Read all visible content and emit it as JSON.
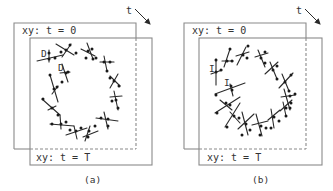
{
  "figure": {
    "width": 333,
    "height": 191,
    "line_color": "#8a8a8a",
    "ink_color": "#2a2a2a"
  },
  "panels": [
    {
      "id": "a",
      "caption": "(a)",
      "caption_pos": [
        84,
        183
      ],
      "frame_back": {
        "label": "xy: t = 0",
        "x": 14,
        "y": 23,
        "w": 122,
        "h": 126,
        "label_pos": [
          22,
          34
        ]
      },
      "frame_front": {
        "label": "xy: t = T",
        "x": 30,
        "y": 38,
        "w": 122,
        "h": 127,
        "label_pos": [
          36,
          161
        ]
      },
      "time_arrow": {
        "label": "t",
        "label_pos": [
          126,
          14
        ],
        "from": [
          135,
          9
        ],
        "to": [
          150,
          24
        ]
      },
      "marks": [
        {
          "text": "D",
          "pos": [
            41,
            57
          ]
        },
        {
          "text": "D",
          "pos": [
            58,
            71
          ]
        }
      ],
      "glyphs": [
        {
          "lines": [
            [
              [
                37,
                61
              ],
              [
                63,
                55
              ]
            ],
            [
              [
                49,
                50
              ],
              [
                49,
                62
              ]
            ]
          ],
          "dots": [
            [
              49,
              59
            ],
            [
              49,
              53
            ],
            [
              55,
              58
            ]
          ]
        },
        {
          "lines": [
            [
              [
                56,
                44
              ],
              [
                74,
                55
              ]
            ],
            [
              [
                62,
                57
              ],
              [
                71,
                44
              ]
            ]
          ],
          "dots": [
            [
              66,
              50
            ],
            [
              70,
              45
            ],
            [
              61,
              52
            ],
            [
              76,
              53
            ]
          ]
        },
        {
          "lines": [
            [
              [
                81,
                49
              ],
              [
                95,
                56
              ]
            ],
            [
              [
                87,
                43
              ],
              [
                93,
                59
              ]
            ]
          ],
          "dots": [
            [
              88,
              51
            ],
            [
              92,
              49
            ],
            [
              86,
              58
            ],
            [
              93,
              59
            ]
          ]
        },
        {
          "lines": [
            [
              [
                100,
                62
              ],
              [
                114,
                62
              ]
            ],
            [
              [
                104,
                56
              ],
              [
                107,
                71
              ]
            ]
          ],
          "dots": [
            [
              104,
              62
            ],
            [
              96,
              58
            ],
            [
              110,
              62
            ],
            [
              107,
              71
            ]
          ]
        },
        {
          "lines": [
            [
              [
                110,
                76
              ],
              [
                120,
                86
              ]
            ],
            [
              [
                118,
                74
              ],
              [
                110,
                88
              ]
            ]
          ],
          "dots": [
            [
              114,
              81
            ],
            [
              110,
              78
            ],
            [
              119,
              86
            ]
          ]
        },
        {
          "lines": [
            [
              [
                110,
                97
              ],
              [
                122,
                96
              ]
            ],
            [
              [
                114,
                91
              ],
              [
                118,
                110
              ]
            ]
          ],
          "dots": [
            [
              116,
              100
            ],
            [
              112,
              101
            ],
            [
              118,
              108
            ]
          ]
        },
        {
          "lines": [
            [
              [
                96,
                118
              ],
              [
                118,
                121
              ]
            ],
            [
              [
                104,
                112
              ],
              [
                108,
                129
              ]
            ]
          ],
          "dots": [
            [
              108,
              119
            ],
            [
              101,
              118
            ],
            [
              108,
              126
            ]
          ]
        },
        {
          "lines": [
            [
              [
                83,
                137
              ],
              [
                98,
                131
              ]
            ],
            [
              [
                90,
                126
              ],
              [
                85,
                141
              ]
            ]
          ],
          "dots": [
            [
              89,
              131
            ],
            [
              95,
              126
            ],
            [
              88,
              137
            ]
          ]
        },
        {
          "lines": [
            [
              [
                66,
                135
              ],
              [
                87,
                128
              ]
            ],
            [
              [
                74,
                126
              ],
              [
                77,
                139
              ]
            ]
          ],
          "dots": [
            [
              76,
              131
            ],
            [
              70,
              130
            ],
            [
              81,
              128
            ]
          ]
        },
        {
          "lines": [
            [
              [
                50,
                124
              ],
              [
                74,
                126
              ]
            ],
            [
              [
                60,
                115
              ],
              [
                61,
                129
              ]
            ]
          ],
          "dots": [
            [
              61,
              124
            ],
            [
              52,
              124
            ],
            [
              66,
              122
            ]
          ]
        },
        {
          "lines": [
            [
              [
                42,
                99
              ],
              [
                60,
                115
              ]
            ],
            [
              [
                48,
                110
              ],
              [
                56,
                106
              ]
            ]
          ],
          "dots": [
            [
              52,
              108
            ],
            [
              43,
              99
            ],
            [
              58,
              115
            ]
          ]
        },
        {
          "lines": [
            [
              [
                50,
                75
              ],
              [
                58,
                102
              ]
            ],
            [
              [
                52,
                94
              ],
              [
                58,
                86
              ]
            ]
          ],
          "dots": [
            [
              54,
              89
            ],
            [
              50,
              75
            ],
            [
              57,
              87
            ]
          ]
        },
        {
          "lines": [
            [
              [
                62,
                64
              ],
              [
                68,
                82
              ]
            ],
            [
              [
                60,
                73
              ],
              [
                70,
                72
              ]
            ]
          ],
          "dots": [
            [
              66,
              73
            ],
            [
              68,
              72
            ],
            [
              62,
              82
            ]
          ]
        }
      ]
    },
    {
      "id": "b",
      "caption": "(b)",
      "caption_pos": [
        252,
        183
      ],
      "frame_back": {
        "label": "xy: t = 0",
        "x": 184,
        "y": 23,
        "w": 122,
        "h": 126,
        "label_pos": [
          192,
          34
        ]
      },
      "frame_front": {
        "label": "xy: t = T",
        "x": 199,
        "y": 38,
        "w": 123,
        "h": 127,
        "label_pos": [
          207,
          161
        ]
      },
      "time_arrow": {
        "label": "t",
        "label_pos": [
          296,
          14
        ],
        "from": [
          305,
          9
        ],
        "to": [
          320,
          24
        ]
      },
      "marks": [
        {
          "text": "I",
          "pos": [
            209,
            72
          ]
        },
        {
          "text": "I",
          "pos": [
            224,
            86
          ]
        }
      ],
      "glyphs": [
        {
          "lines": [
            [
              [
                216,
                59
              ],
              [
                216,
                85
              ]
            ],
            [
              [
                211,
                74
              ],
              [
                222,
                70
              ]
            ]
          ],
          "dots": [
            [
              216,
              72
            ],
            [
              216,
              60
            ],
            [
              221,
              70
            ]
          ]
        },
        {
          "lines": [
            [
              [
                224,
                67
              ],
              [
                230,
                49
              ]
            ],
            [
              [
                222,
                61
              ],
              [
                233,
                61
              ]
            ]
          ],
          "dots": [
            [
              227,
              61
            ],
            [
              230,
              49
            ],
            [
              232,
              61
            ]
          ]
        },
        {
          "lines": [
            [
              [
                237,
                65
              ],
              [
                246,
                47
              ]
            ],
            [
              [
                236,
                56
              ],
              [
                249,
                52
              ]
            ]
          ],
          "dots": [
            [
              243,
              55
            ],
            [
              248,
              46
            ],
            [
              247,
              58
            ]
          ]
        },
        {
          "lines": [
            [
              [
                255,
                57
              ],
              [
                268,
                53
              ]
            ],
            [
              [
                258,
                50
              ],
              [
                265,
                67
              ]
            ]
          ],
          "dots": [
            [
              261,
              58
            ],
            [
              265,
              52
            ],
            [
              265,
              63
            ]
          ]
        },
        {
          "lines": [
            [
              [
                265,
                74
              ],
              [
                278,
                62
              ]
            ],
            [
              [
                270,
                62
              ],
              [
                277,
                79
              ]
            ]
          ],
          "dots": [
            [
              273,
              70
            ],
            [
              277,
              66
            ],
            [
              277,
              79
            ]
          ]
        },
        {
          "lines": [
            [
              [
                279,
                88
              ],
              [
                293,
                73
              ]
            ],
            [
              [
                282,
                74
              ],
              [
                289,
                91
              ]
            ]
          ],
          "dots": [
            [
              285,
              82
            ],
            [
              291,
              75
            ],
            [
              289,
              91
            ]
          ]
        },
        {
          "lines": [
            [
              [
                281,
                97
              ],
              [
                295,
                95
              ]
            ],
            [
              [
                284,
                89
              ],
              [
                290,
                110
              ]
            ]
          ],
          "dots": [
            [
              290,
              96
            ],
            [
              295,
              94
            ],
            [
              290,
              108
            ]
          ]
        },
        {
          "lines": [
            [
              [
                280,
                111
              ],
              [
                292,
                100
              ]
            ],
            [
              [
                283,
                102
              ],
              [
                286,
                116
              ]
            ]
          ],
          "dots": [
            [
              286,
              108
            ],
            [
              291,
              103
            ],
            [
              286,
              116
            ]
          ]
        },
        {
          "lines": [
            [
              [
                268,
                120
              ],
              [
                280,
                110
              ]
            ],
            [
              [
                271,
                109
              ],
              [
                274,
                128
              ]
            ]
          ],
          "dots": [
            [
              274,
              117
            ],
            [
              279,
              121
            ],
            [
              271,
              128
            ]
          ]
        },
        {
          "lines": [
            [
              [
                252,
                125
              ],
              [
                268,
                121
              ]
            ],
            [
              [
                256,
                114
              ],
              [
                262,
                136
              ]
            ]
          ],
          "dots": [
            [
              261,
              126
            ],
            [
              266,
              128
            ],
            [
              260,
              135
            ]
          ]
        },
        {
          "lines": [
            [
              [
                238,
                129
              ],
              [
                254,
                114
              ]
            ],
            [
              [
                242,
                112
              ],
              [
                248,
                135
              ]
            ]
          ],
          "dots": [
            [
              246,
              124
            ],
            [
              250,
              130
            ],
            [
              242,
              135
            ]
          ]
        },
        {
          "lines": [
            [
              [
                225,
                127
              ],
              [
                240,
                103
              ]
            ],
            [
              [
                230,
                112
              ],
              [
                240,
                123
              ]
            ]
          ],
          "dots": [
            [
              234,
              116
            ],
            [
              239,
              118
            ],
            [
              227,
              127
            ]
          ]
        },
        {
          "lines": [
            [
              [
                215,
                113
              ],
              [
                240,
                97
              ]
            ],
            [
              [
                220,
                100
              ],
              [
                232,
                110
              ]
            ]
          ],
          "dots": [
            [
              230,
              105
            ],
            [
              226,
              103
            ],
            [
              217,
              113
            ]
          ]
        },
        {
          "lines": [
            [
              [
                215,
                94
              ],
              [
                245,
                83
              ]
            ],
            [
              [
                230,
                84
              ],
              [
                233,
                96
              ]
            ]
          ],
          "dots": [
            [
              232,
              90
            ],
            [
              231,
              86
            ],
            [
              216,
              95
            ]
          ]
        }
      ]
    }
  ]
}
